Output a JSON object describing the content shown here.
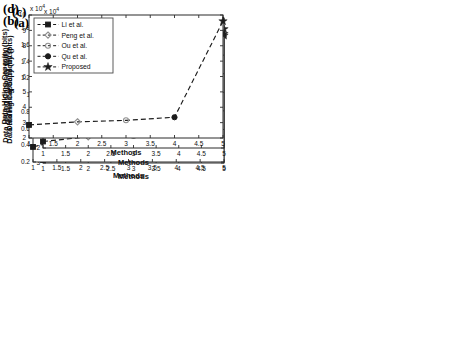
{
  "figure_style": {
    "background": "#ffffff",
    "axis_color": "#2b2b2b",
    "line_color": "#1c1c1c",
    "dark_marker_color": "#1c1c1c",
    "open_marker_color": "#8f8f8f",
    "text_color": "#111111"
  },
  "legend": {
    "position": "top-left",
    "entries": [
      {
        "label": "Li et al.",
        "marker": "filled-square"
      },
      {
        "label": "Peng et al.",
        "marker": "open-diamond"
      },
      {
        "label": "Ou et al.",
        "marker": "open-circle"
      },
      {
        "label": "Qu et al.",
        "marker": "filled-circle"
      },
      {
        "label": "Proposed",
        "marker": "filled-star"
      }
    ]
  },
  "chart_data": [
    {
      "type": "line",
      "panel_label": "(a)",
      "xlabel": "Methods",
      "ylabel": "Data Hiding Capacity (bits)",
      "scale_label": "x 10^4",
      "line_style": "dashed",
      "grid": false,
      "legend_position": "top-left",
      "legend_entries": [
        "Li et al.",
        "Peng et al.",
        "Ou et al.",
        "Qu et al.",
        "Proposed"
      ],
      "x": [
        1,
        2,
        3,
        4,
        5
      ],
      "values": [
        3.2,
        3.8,
        3.7,
        4.6,
        12.0
      ],
      "point_labels": [
        "Li et al.",
        "Peng et al.",
        "Ou et al.",
        "Qu et al.",
        "Proposed"
      ],
      "point_markers": [
        "filled-square",
        "open-diamond",
        "open-circle",
        "filled-circle",
        "filled-star"
      ],
      "xlim": [
        1,
        5
      ],
      "ylim": [
        3,
        12
      ],
      "xticks": [
        1,
        1.5,
        2,
        2.5,
        3,
        3.5,
        4,
        4.5,
        5
      ],
      "yticks": [
        3,
        4,
        5,
        6,
        7,
        8,
        9,
        10,
        11,
        12
      ]
    },
    {
      "type": "line",
      "panel_label": "(b)",
      "xlabel": "Methods",
      "ylabel": "Data Hiding Capacity (bits)",
      "scale_label": "x 10^5",
      "line_style": "dashed",
      "grid": false,
      "legend_position": "top-left",
      "legend_entries": [
        "Li et al.",
        "Peng et al.",
        "Ou et al.",
        "Qu et al.",
        "Proposed"
      ],
      "x": [
        1,
        2,
        3,
        4,
        5
      ],
      "values": [
        0.38,
        0.52,
        0.48,
        0.69,
        1.71
      ],
      "point_labels": [
        "Li et al.",
        "Peng et al.",
        "Ou et al.",
        "Qu et al.",
        "Proposed"
      ],
      "point_markers": [
        "filled-square",
        "open-diamond",
        "open-circle",
        "filled-circle",
        "filled-star"
      ],
      "xlim": [
        1,
        5
      ],
      "ylim": [
        0.2,
        1.8
      ],
      "xticks": [
        1,
        1.5,
        2,
        2.5,
        3,
        3.5,
        4,
        4.5,
        5
      ],
      "yticks": [
        0.2,
        0.4,
        0.6,
        0.8,
        1,
        1.2,
        1.4,
        1.6,
        1.8
      ]
    },
    {
      "type": "line",
      "panel_label": "(c)",
      "xlabel": "Methods",
      "ylabel": "Data Hiding Capacity (bits)",
      "scale_label": "x 10^4",
      "line_style": "dashed",
      "grid": false,
      "legend_position": "top-left",
      "legend_entries": [
        "Li et al.",
        "Peng et al.",
        "Ou et al.",
        "Qu et al.",
        "Proposed"
      ],
      "x": [
        1,
        2,
        3,
        4,
        5
      ],
      "values": [
        2.35,
        2.6,
        2.65,
        2.95,
        8.15
      ],
      "point_labels": [
        "Li et al.",
        "Peng et al.",
        "Ou et al.",
        "Qu et al.",
        "Proposed"
      ],
      "point_markers": [
        "filled-square",
        "open-diamond",
        "open-circle",
        "filled-circle",
        "filled-star"
      ],
      "xlim": [
        1,
        5
      ],
      "ylim": [
        2,
        9
      ],
      "xticks": [
        1,
        1.5,
        2,
        2.5,
        3,
        3.5,
        4,
        4.5,
        5
      ],
      "yticks": [
        2,
        3,
        4,
        5,
        6,
        7,
        8,
        9
      ]
    },
    {
      "type": "line",
      "panel_label": "(d)",
      "xlabel": "Methods",
      "ylabel": "Data Hiding Capacity (bits)",
      "scale_label": "x 10^4",
      "line_style": "dashed",
      "grid": false,
      "legend_position": "top-left",
      "legend_entries": [
        "Li et al.",
        "Peng et al.",
        "Ou et al.",
        "Qu et al.",
        "Proposed"
      ],
      "x": [
        1,
        2,
        3,
        4,
        5
      ],
      "values": [
        2.85,
        3.05,
        3.15,
        3.35,
        9.6
      ],
      "point_labels": [
        "Li et al.",
        "Peng et al.",
        "Ou et al.",
        "Qu et al.",
        "Proposed"
      ],
      "point_markers": [
        "filled-square",
        "open-diamond",
        "open-circle",
        "filled-circle",
        "filled-star"
      ],
      "xlim": [
        1,
        5
      ],
      "ylim": [
        2,
        10
      ],
      "xticks": [
        1,
        1.5,
        2,
        2.5,
        3,
        3.5,
        4,
        4.5,
        5
      ],
      "yticks": [
        2,
        3,
        4,
        5,
        6,
        7,
        8,
        9,
        10
      ]
    }
  ]
}
